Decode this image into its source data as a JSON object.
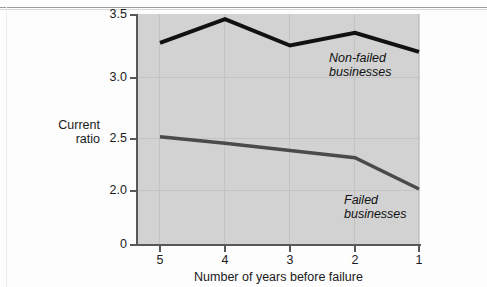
{
  "chart_data": {
    "type": "line",
    "title": "",
    "subtitle": "",
    "xlabel": "Number of years before failure",
    "ylabel": "Current ratio",
    "ylabel_lines": [
      "Current",
      "ratio"
    ],
    "categories": [
      "5",
      "4",
      "3",
      "2",
      "1"
    ],
    "x": [
      5,
      4,
      3,
      2,
      1
    ],
    "yticks": [
      "3.5",
      "3.0",
      "2.5",
      "2.0",
      "0"
    ],
    "ytick_values": [
      3.5,
      3.0,
      2.5,
      2.0,
      0
    ],
    "ylim": [
      0,
      3.5
    ],
    "y_axis_broken": true,
    "grid": true,
    "grid_orientation": "both",
    "legend_position": "inline-annotations",
    "plot_background": "#d2d2d2",
    "series": [
      {
        "name": "Non-failed businesses",
        "label": "Non-failed\nbusinesses",
        "label_lines": [
          "Non-failed",
          "businesses"
        ],
        "color": "#111111",
        "line_width": 4,
        "values": [
          3.27,
          3.46,
          3.25,
          3.35,
          3.2
        ]
      },
      {
        "name": "Failed businesses",
        "label": "Failed\nbusinesses",
        "label_lines": [
          "Failed",
          "businesses"
        ],
        "color": "#4a4a4a",
        "line_width": 3.5,
        "values": [
          2.51,
          2.45,
          2.38,
          2.31,
          2.01
        ]
      }
    ],
    "annotations": [
      {
        "text": "Non-failed businesses",
        "series": "Non-failed businesses"
      },
      {
        "text": "Failed businesses",
        "series": "Failed businesses"
      }
    ]
  },
  "axis": {
    "y_ticks": [
      {
        "label": "3.5",
        "top": 8
      },
      {
        "label": "3.0",
        "top": 71
      },
      {
        "label": "2.5",
        "top": 132
      },
      {
        "label": "2.0",
        "top": 184
      },
      {
        "label": "0",
        "top": 238
      }
    ],
    "x_ticks": [
      {
        "label": "5",
        "left": 160
      },
      {
        "label": "4",
        "left": 225
      },
      {
        "label": "3",
        "left": 290
      },
      {
        "label": "2",
        "left": 355
      },
      {
        "label": "1",
        "left": 419
      }
    ]
  },
  "labels": {
    "x_axis_title": "Number of years before failure",
    "y_axis_title_line1": "Current",
    "y_axis_title_line2": "ratio",
    "series1_line1": "Non-failed",
    "series1_line2": "businesses",
    "series2_line1": "Failed",
    "series2_line2": "businesses"
  }
}
